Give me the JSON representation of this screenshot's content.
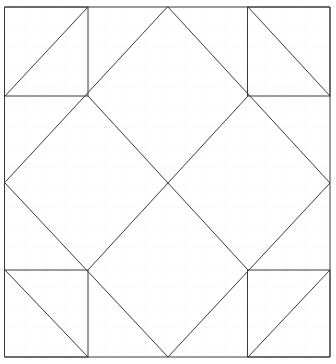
{
  "figure": {
    "canvas": {
      "width": 336,
      "height": 364,
      "background": "#ffffff"
    },
    "style": {
      "stroke_color": "#3a3a3a",
      "stroke_width": 1,
      "grid_color": "#dcdce4",
      "grid_minor_color": "#e8e8f0",
      "fill": "none"
    },
    "grid": {
      "visible": true,
      "type": "dotted",
      "minor_spacing": 20,
      "origin_x": 5,
      "origin_y": 7,
      "x_lines": [
        25,
        45,
        65,
        85,
        105,
        125,
        145,
        165,
        185,
        205,
        225,
        245,
        265,
        285,
        305,
        325
      ],
      "y_lines": [
        27,
        47,
        67,
        87,
        107,
        127,
        147,
        167,
        187,
        207,
        227,
        247,
        267,
        287,
        307,
        327,
        347
      ]
    },
    "frame": {
      "label": "outer-square",
      "x": 5,
      "y": 7,
      "width": 325,
      "height": 350,
      "corners": [
        [
          5,
          7
        ],
        [
          330,
          7
        ],
        [
          330,
          357
        ],
        [
          5,
          357
        ]
      ]
    },
    "key_points": {
      "top_mid": [
        168,
        7
      ],
      "bottom_mid": [
        168,
        357
      ],
      "left_mid": [
        5,
        183
      ],
      "right_mid": [
        330,
        183
      ],
      "center": [
        168,
        183
      ],
      "inner_tl": [
        88,
        96
      ],
      "inner_tr": [
        248,
        96
      ],
      "inner_bl": [
        88,
        270
      ],
      "inner_br": [
        248,
        270
      ]
    },
    "shapes": [
      {
        "name": "outer-frame-square",
        "type": "polygon",
        "points": "5,7 330,7 330,357 5,357"
      },
      {
        "name": "large-inscribed-diamond",
        "type": "polygon",
        "points": "168,7 330,183 168,357 5,183"
      },
      {
        "name": "corner-square-top-left",
        "type": "polygon",
        "points": "5,7 88,7 88,96 5,96"
      },
      {
        "name": "corner-square-top-right",
        "type": "polygon",
        "points": "248,7 330,7 330,96 248,96"
      },
      {
        "name": "corner-square-bottom-left",
        "type": "polygon",
        "points": "5,270 88,270 88,357 5,357"
      },
      {
        "name": "corner-square-bottom-right",
        "type": "polygon",
        "points": "248,270 330,270 330,357 248,357"
      },
      {
        "name": "diagonal-top-left-corner",
        "type": "line",
        "points": "5,96 88,7"
      },
      {
        "name": "diagonal-top-right-corner",
        "type": "line",
        "points": "248,7 330,96"
      },
      {
        "name": "diagonal-bottom-left-corner",
        "type": "line",
        "points": "5,270 88,357"
      },
      {
        "name": "diagonal-bottom-right-corner",
        "type": "line",
        "points": "248,357 330,270"
      },
      {
        "name": "inner-diagonal-nw-se",
        "type": "line",
        "points": "88,96 248,270"
      },
      {
        "name": "inner-diagonal-ne-sw",
        "type": "line",
        "points": "248,96 88,270"
      }
    ]
  }
}
